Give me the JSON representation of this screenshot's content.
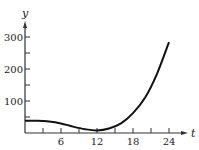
{
  "chart_data": {
    "type": "line",
    "title": "",
    "xlabel": "t",
    "ylabel": "y",
    "xlim": [
      0,
      26
    ],
    "ylim": [
      0,
      330
    ],
    "grid": false,
    "legend": null,
    "x_ticks": [
      3,
      6,
      9,
      12,
      15,
      18,
      21,
      24
    ],
    "x_tick_labels": [
      "",
      "6",
      "",
      "12",
      "",
      "18",
      "",
      "24"
    ],
    "y_ticks": [
      50,
      100,
      150,
      200,
      250,
      300
    ],
    "y_tick_labels": [
      "",
      "100",
      "",
      "200",
      "",
      "300"
    ],
    "series": [
      {
        "name": "y(t)",
        "x": [
          0,
          2,
          4,
          6,
          8,
          10,
          12,
          14,
          16,
          18,
          20,
          22,
          24
        ],
        "values": [
          38,
          38,
          36,
          30,
          20,
          12,
          8,
          14,
          30,
          62,
          110,
          185,
          284
        ]
      }
    ],
    "colors": {
      "line": "#111111",
      "axis": "#333333"
    }
  }
}
